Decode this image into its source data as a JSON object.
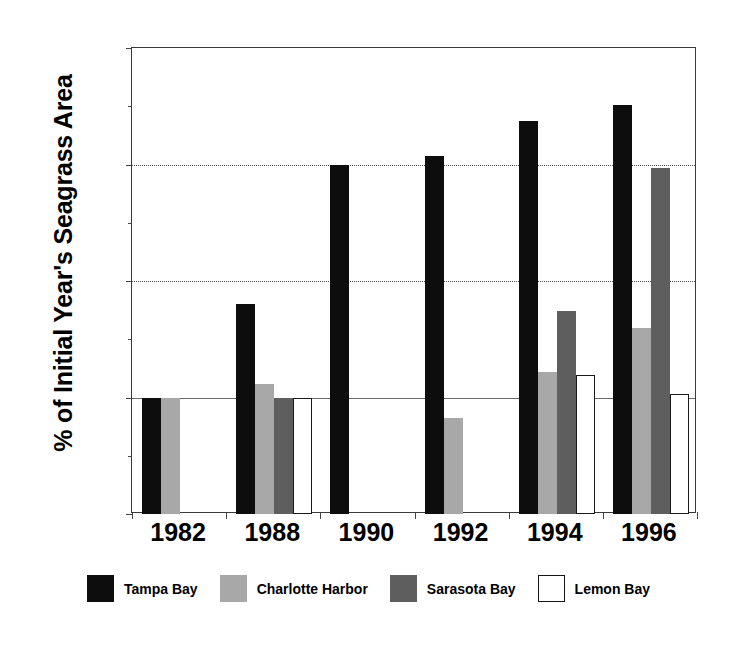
{
  "chart_data": {
    "type": "bar",
    "title": "",
    "subtitle": "",
    "xlabel": "",
    "ylabel": "% of Initial Year's Seagrass Area",
    "categories": [
      "1982",
      "1988",
      "1990",
      "1992",
      "1994",
      "1996"
    ],
    "ylim": [
      0.9,
      1.3
    ],
    "ytick_labels": [
      "0.9",
      "1",
      "1.1",
      "1.2",
      "1.3"
    ],
    "ytick_values": [
      0.9,
      1.0,
      1.1,
      1.2,
      1.3
    ],
    "yminor_ticks": [
      0.95,
      1.05,
      1.15,
      1.25
    ],
    "grid": "horizontal-major",
    "legend_position": "bottom",
    "baseline": 1.0,
    "series": [
      {
        "name": "Tampa Bay",
        "color": "#0d0d0d",
        "values": [
          1.0,
          1.08,
          1.2,
          1.207,
          1.237,
          1.251
        ]
      },
      {
        "name": "Charlotte Harbor",
        "color": "#a8a8a8",
        "values": [
          1.0,
          1.012,
          null,
          0.982,
          1.022,
          1.06
        ]
      },
      {
        "name": "Sarasota Bay",
        "color": "#5e5e5e",
        "values": [
          null,
          1.0,
          null,
          null,
          1.074,
          1.197
        ]
      },
      {
        "name": "Lemon Bay",
        "color": "#ffffff",
        "values": [
          null,
          1.0,
          null,
          null,
          1.019,
          1.003
        ]
      }
    ]
  }
}
